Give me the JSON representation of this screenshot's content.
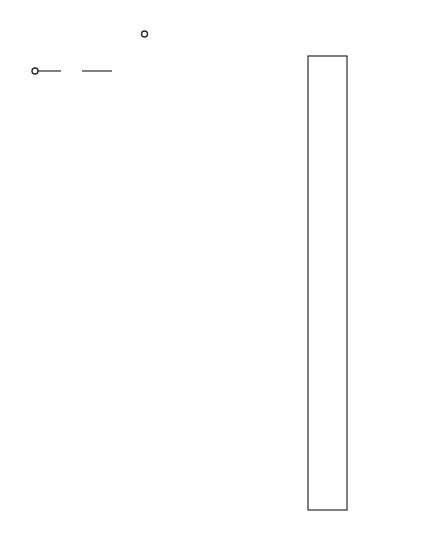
{
  "diagram": {
    "input_label": "E",
    "reference_label_main": "E",
    "reference_label_sub": "in",
    "series_resistor_label": "3R/2",
    "ladder_resistor_labels": [
      "R",
      "R",
      "R",
      "R"
    ],
    "last_resistor_label_num": "R",
    "last_resistor_label_den": "2",
    "comparator_count": 5,
    "comparator_minus_symbol": "−",
    "comparator_plus_symbol": "+",
    "decoder_letters": [
      "D",
      "E",
      "C",
      "O",
      "D",
      "E",
      "R",
      " ",
      "L",
      "O",
      "G",
      "I",
      "C"
    ],
    "output_letters": [
      "O",
      "U",
      "T",
      "P",
      "U",
      "T"
    ],
    "output_count": 7,
    "ground_symbol": "ground-icon"
  }
}
